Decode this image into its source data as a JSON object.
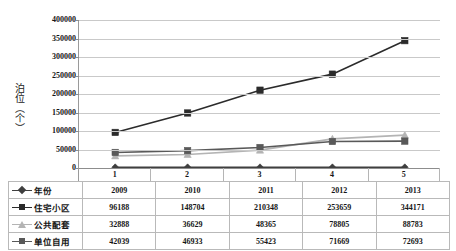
{
  "chart_data": {
    "type": "line",
    "title": "",
    "xlabel": "",
    "ylabel": "泊位（个）",
    "categories": [
      "1",
      "2",
      "3",
      "4",
      "5"
    ],
    "ylim": [
      0,
      400000
    ],
    "ytick_step": 50000,
    "yticks": [
      "400000",
      "350000",
      "300000",
      "250000",
      "200000",
      "150000",
      "100000",
      "50000",
      "0"
    ],
    "grid": true,
    "legend_position": "data-table-below",
    "series": [
      {
        "name": "年份",
        "marker": "diamond",
        "color": "#3f3f3f",
        "values": [
          2009,
          2010,
          2011,
          2012,
          2013
        ],
        "plotted_values": [
          2009,
          2010,
          2011,
          2012,
          2013
        ],
        "display": [
          "2009",
          "2010",
          "2011",
          "2012",
          "2013"
        ]
      },
      {
        "name": "住宅小区",
        "marker": "square",
        "color": "#2b2b2b",
        "values": [
          96188,
          148704,
          210348,
          253659,
          344171
        ],
        "plotted_values": [
          96188,
          148704,
          210348,
          253659,
          344171
        ],
        "display": [
          "96188",
          "148704",
          "210348",
          "253659",
          "344171"
        ]
      },
      {
        "name": "公共配套",
        "marker": "triangle",
        "color": "#b4b4b4",
        "values": [
          32888,
          36629,
          48365,
          78805,
          88783
        ],
        "plotted_values": [
          32888,
          36629,
          48365,
          78805,
          88783
        ],
        "display": [
          "32888",
          "36629",
          "48365",
          "78805",
          "88783"
        ]
      },
      {
        "name": "单位自用",
        "marker": "square",
        "color": "#595959",
        "values": [
          42039,
          46933,
          55423,
          71669,
          72693
        ],
        "plotted_values": [
          42039,
          46933,
          55423,
          71669,
          72693
        ],
        "display": [
          "42039",
          "46933",
          "55423",
          "71669",
          "72693"
        ]
      }
    ]
  },
  "table": {
    "row_labels": [
      "年份",
      "住宅小区",
      "公共配套",
      "单位自用"
    ],
    "columns": [
      "1",
      "2",
      "3",
      "4",
      "5"
    ],
    "rows": [
      [
        "2009",
        "2010",
        "2011",
        "2012",
        "2013"
      ],
      [
        "96188",
        "148704",
        "210348",
        "253659",
        "344171"
      ],
      [
        "32888",
        "36629",
        "48365",
        "78805",
        "88783"
      ],
      [
        "42039",
        "46933",
        "55423",
        "71669",
        "72693"
      ]
    ]
  },
  "colors": {
    "grid": "#c9c9c9",
    "axis": "#8d8d8d",
    "series_year": "#3f3f3f",
    "series_residential": "#2b2b2b",
    "series_public": "#b4b4b4",
    "series_unit": "#595959",
    "table_border": "#b9b9b9",
    "text": "#161616"
  }
}
